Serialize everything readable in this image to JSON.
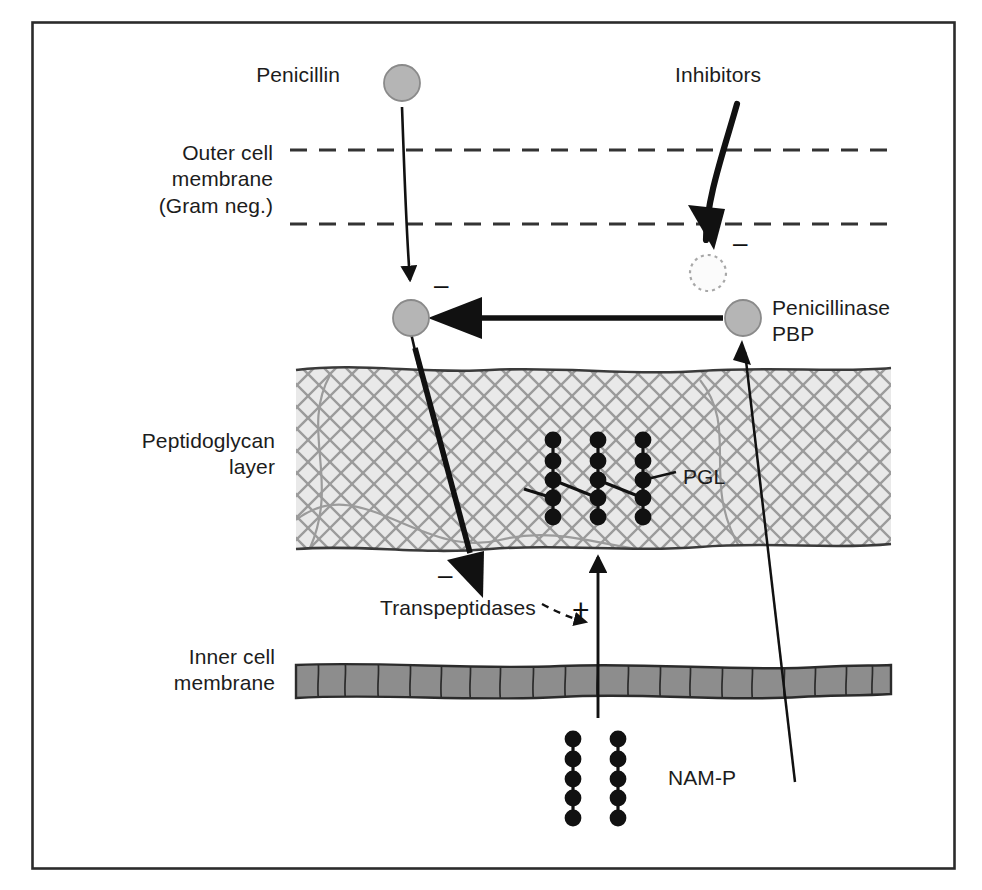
{
  "figure": {
    "type": "biological-schematic",
    "topic": "Penicillin action on bacterial cell wall synthesis",
    "border_color": "#2b2b2b",
    "background": "#ffffff"
  },
  "colors": {
    "enzyme_circle_fill": "#b5b5b5",
    "enzyme_circle_stroke": "#8a8a8a",
    "peptidoglycan_fill": "#e8e8e8",
    "peptidoglycan_mesh": "#9a9a9a",
    "peptidoglycan_edge": "#3a3a3a",
    "inner_membrane_fill": "#8d8d8d",
    "inner_membrane_edge": "#2b2b2b",
    "dot_color": "#111111",
    "arrow_color": "#111111",
    "dashed_membrane": "#333333",
    "text_color": "#1c1c1c"
  },
  "labels": {
    "penicillin": "Penicillin",
    "inhibitors": "Inhibitors",
    "outer_membrane": "Outer cell\nmembrane\n(Gram neg.)",
    "peptidoglycan": "Peptidoglycan\nlayer",
    "inner_membrane": "Inner cell\nmembrane",
    "penicillinase": "Penicillinase\nPBP",
    "pgl": "PGL",
    "transpeptidases": "Transpeptidases",
    "nam_p": "NAM-P"
  },
  "signs": {
    "penicillin_inhibition": "–",
    "inhibitor_inhibition": "–",
    "transpeptidase_inhibition": "–",
    "nam_p_stimulation": "+"
  },
  "structures": {
    "pgl_chains": 3,
    "pgl_dots_per_chain": 5,
    "pgl_crosslinks": 2,
    "nam_p_chains": 2,
    "nam_p_dots_per_chain": 5,
    "outer_membrane_leaflets": 2,
    "enzyme_circles": 3,
    "dotted_inhibited_circle": 1
  },
  "icons": {
    "penicillin_molecule": "gray-circle-icon",
    "penicillinase_enzyme": "gray-circle-icon",
    "target_pbp": "gray-circle-icon",
    "inhibited_enzyme": "dotted-circle-icon",
    "inhibition_sign": "minus-icon",
    "stimulation_sign": "plus-icon",
    "flow_arrow": "arrow-icon"
  }
}
